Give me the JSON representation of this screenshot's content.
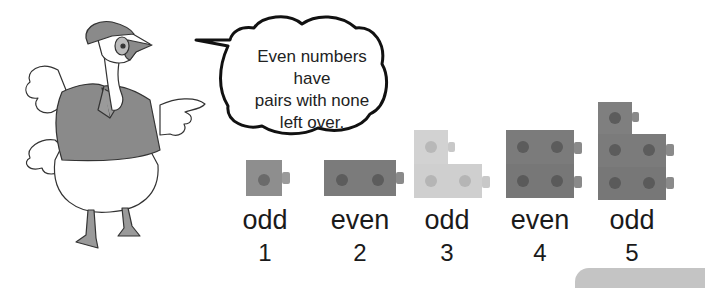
{
  "speech_bubble": {
    "lines": [
      "Even numbers have",
      "pairs with none",
      "left over."
    ]
  },
  "character": "goose-with-cap-and-shirt",
  "examples": [
    {
      "word": "odd",
      "number": "1",
      "cubes": 1,
      "color": "#8e8e8e"
    },
    {
      "word": "even",
      "number": "2",
      "cubes": 2,
      "color": "#7b7b7b"
    },
    {
      "word": "odd",
      "number": "3",
      "cubes": 3,
      "color": "#cfcfcf"
    },
    {
      "word": "even",
      "number": "4",
      "cubes": 4,
      "color": "#7b7b7b"
    },
    {
      "word": "odd",
      "number": "5",
      "cubes": 5,
      "color": "#7f7f7f"
    }
  ],
  "colors": {
    "text": "#1a1a1a",
    "shirt": "#8a8a8a",
    "bottom_tab": "#c4c4c4"
  }
}
